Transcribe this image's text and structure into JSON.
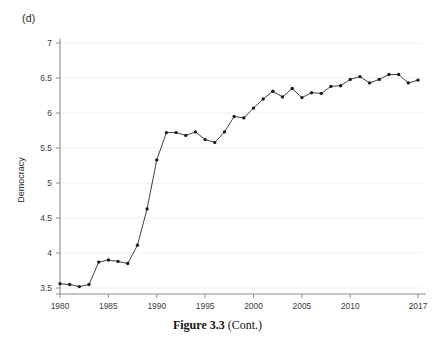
{
  "figure": {
    "panel_label": "(d)",
    "caption_bold": "Figure 3.3",
    "caption_rest": " (Cont.)"
  },
  "chart_data": {
    "type": "line",
    "title": "",
    "subtitle": "",
    "xlabel": "",
    "ylabel": "Democracy",
    "xlim": [
      1980,
      2017
    ],
    "ylim": [
      3.5,
      7
    ],
    "grid": true,
    "grid_axis": "y",
    "legend": false,
    "legend_position": "none",
    "marker": "filled-circle",
    "line_color": "#2a2a33",
    "marker_color": "#1b1b22",
    "x_tick_labels": [
      "1980",
      "1985",
      "1990",
      "1995",
      "2000",
      "2005",
      "2010",
      "2017"
    ],
    "x_tick_values": [
      1980,
      1985,
      1990,
      1995,
      2000,
      2005,
      2010,
      2017
    ],
    "y_tick_labels": [
      "3.5",
      "4",
      "4.5",
      "5",
      "5.5",
      "6",
      "6.5",
      "7"
    ],
    "y_tick_values": [
      3.5,
      4,
      4.5,
      5,
      5.5,
      6,
      6.5,
      7
    ],
    "x": [
      1980,
      1981,
      1982,
      1983,
      1984,
      1985,
      1986,
      1987,
      1988,
      1989,
      1990,
      1991,
      1992,
      1993,
      1994,
      1995,
      1996,
      1997,
      1998,
      1999,
      2000,
      2001,
      2002,
      2003,
      2004,
      2005,
      2006,
      2007,
      2008,
      2009,
      2010,
      2011,
      2012,
      2013,
      2014,
      2015,
      2016,
      2017
    ],
    "series": [
      {
        "name": "Democracy",
        "values": [
          3.56,
          3.55,
          3.52,
          3.55,
          3.87,
          3.9,
          3.88,
          3.85,
          4.11,
          4.63,
          5.33,
          5.72,
          5.72,
          5.68,
          5.73,
          5.62,
          5.58,
          5.73,
          5.95,
          5.93,
          6.07,
          6.2,
          6.31,
          6.23,
          6.35,
          6.22,
          6.29,
          6.28,
          6.38,
          6.39,
          6.48,
          6.52,
          6.43,
          6.48,
          6.55,
          6.55,
          6.43,
          6.47
        ]
      }
    ]
  }
}
